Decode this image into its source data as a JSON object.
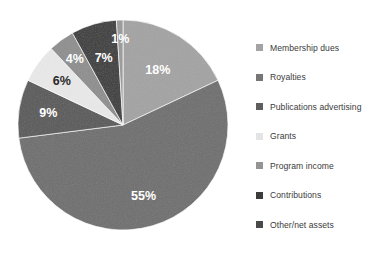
{
  "chart_data": {
    "type": "pie",
    "title": "",
    "xlabel": "",
    "ylabel": "",
    "legend_position": "right",
    "grid": false,
    "start_angle_deg": 0,
    "direction": "clockwise",
    "units": "percent",
    "categories": [
      "Membership dues",
      "Royalties",
      "Publications advertising",
      "Grants",
      "Program income",
      "Contributions",
      "Other/net assets"
    ],
    "values": [
      18,
      55,
      9,
      6,
      4,
      7,
      1
    ],
    "labels": [
      "18%",
      "55%",
      "9%",
      "6%",
      "4%",
      "7%",
      "1%"
    ],
    "colors": [
      "#a3a3a3",
      "#6e6e6e",
      "#585858",
      "#e9e9e9",
      "#8e8e8e",
      "#3a3a3a",
      "#9a9a9a"
    ],
    "label_colors": [
      "#ffffff",
      "#ffffff",
      "#ffffff",
      "#2b2b2b",
      "#ffffff",
      "#ffffff",
      "#ffffff"
    ],
    "slices": [
      {
        "category": "Membership dues",
        "value": 18,
        "label": "18%",
        "color": "#a3a3a3",
        "label_color": "#ffffff"
      },
      {
        "category": "Royalties",
        "value": 55,
        "label": "55%",
        "color": "#6e6e6e",
        "label_color": "#ffffff"
      },
      {
        "category": "Publications advertising",
        "value": 9,
        "label": "9%",
        "color": "#585858",
        "label_color": "#ffffff"
      },
      {
        "category": "Grants",
        "value": 6,
        "label": "6%",
        "color": "#e9e9e9",
        "label_color": "#2b2b2b"
      },
      {
        "category": "Program income",
        "value": 4,
        "label": "4%",
        "color": "#8e8e8e",
        "label_color": "#ffffff"
      },
      {
        "category": "Contributions",
        "value": 7,
        "label": "7%",
        "color": "#3a3a3a",
        "label_color": "#ffffff"
      },
      {
        "category": "Other/net assets",
        "value": 1,
        "label": "1%",
        "color": "#9a9a9a",
        "label_color": "#ffffff"
      }
    ]
  },
  "legend": {
    "items": [
      {
        "label": "Membership dues",
        "color": "#a3a3a3"
      },
      {
        "label": "Royalties",
        "color": "#767676"
      },
      {
        "label": "Publications advertising",
        "color": "#5e5e5e"
      },
      {
        "label": "Grants",
        "color": "#e4e4e4"
      },
      {
        "label": "Program income",
        "color": "#949494"
      },
      {
        "label": "Contributions",
        "color": "#3c3c3c"
      },
      {
        "label": "Other/net assets",
        "color": "#4a4a4a"
      }
    ]
  },
  "geometry": {
    "center_x": 123,
    "center_y": 125,
    "radius": 105
  },
  "background_color": "#ffffff"
}
